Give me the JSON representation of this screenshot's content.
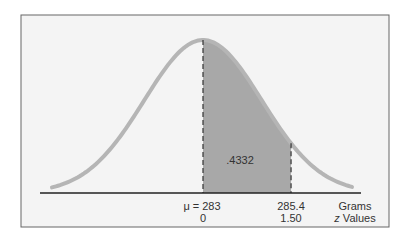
{
  "chart_data": {
    "type": "area",
    "title": "",
    "mean_label": "μ = 283",
    "mean_value": 283,
    "shaded_region": {
      "from_z": 0,
      "to_z": 1.5,
      "from_grams": 283,
      "to_grams": 285.4,
      "area": 0.4332,
      "area_label": ".4332"
    },
    "x_ticks_grams": [
      "μ = 283",
      "285.4"
    ],
    "x_ticks_z": [
      "0",
      "1.50"
    ],
    "xlabel_grams": "Grams",
    "xlabel_z": "z Values",
    "colors": {
      "curve": "#b3b3b3",
      "shade": "#a6a6a6",
      "background": "#f3f3f3",
      "frame": "#555555"
    }
  },
  "labels": {
    "area": ".4332",
    "mean_grams": "μ = 283",
    "mean_z": "0",
    "upper_grams": "285.4",
    "upper_z": "1.50",
    "axis_grams": "Grams",
    "axis_z": "z Values"
  }
}
